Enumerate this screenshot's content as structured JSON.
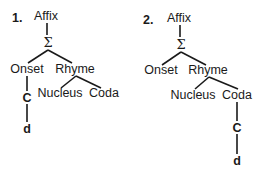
{
  "diagrams": [
    {
      "number": "1.",
      "root": "Affix",
      "sigma": "Σ",
      "onset": "Onset",
      "rhyme": "Rhyme",
      "nucleus": "Nucleus",
      "coda": "Coda",
      "consonant": "C",
      "segment": "d",
      "attachment": "Onset"
    },
    {
      "number": "2.",
      "root": "Affix",
      "sigma": "Σ",
      "onset": "Onset",
      "rhyme": "Rhyme",
      "nucleus": "Nucleus",
      "coda": "Coda",
      "consonant": "C",
      "segment": "d",
      "attachment": "Coda"
    }
  ]
}
